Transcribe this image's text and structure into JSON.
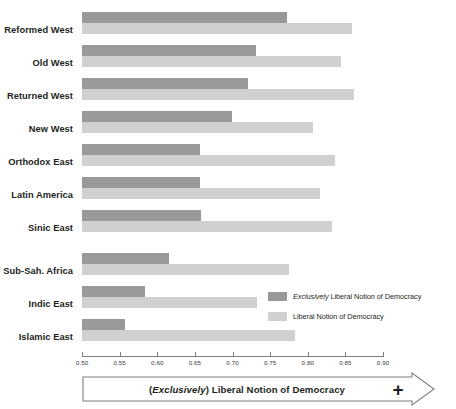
{
  "chart_data": {
    "type": "bar",
    "orientation": "horizontal",
    "title": "",
    "xlabel": "(Exclusively) Liberal Notion of Democracy",
    "ylabel": "",
    "xlim": [
      0.5,
      0.9
    ],
    "xticks": [
      "0.50",
      "0.55",
      "0.60",
      "0.65",
      "0.70",
      "0.75",
      "0.80",
      "0.85",
      "0.90"
    ],
    "xtick_values": [
      0.5,
      0.55,
      0.6,
      0.65,
      0.7,
      0.75,
      0.8,
      0.85,
      0.9
    ],
    "grid": false,
    "legend_position": "inside-right-lower",
    "categories": [
      "Reformed West",
      "Old West",
      "Returned West",
      "New West",
      "Orthodox East",
      "Latin America",
      "Sinic East",
      "Sub-Sah. Africa",
      "Indic East",
      "Islamic East"
    ],
    "series": [
      {
        "name": "Exclusively Liberal Notion of Democracy",
        "color": "#999999",
        "values": [
          0.773,
          0.731,
          0.72,
          0.699,
          0.657,
          0.657,
          0.658,
          0.616,
          0.584,
          0.557
        ]
      },
      {
        "name": "Liberal Notion of Democracy",
        "color": "#d0d0d0",
        "values": [
          0.859,
          0.844,
          0.862,
          0.807,
          0.836,
          0.816,
          0.832,
          0.775,
          0.733,
          0.783
        ]
      }
    ]
  },
  "legend": {
    "items": [
      {
        "prefix_italic": "Exclusively",
        "rest": " Liberal Notion of Democracy",
        "color": "#999999"
      },
      {
        "prefix_italic": "",
        "rest": "Liberal Notion of Democracy",
        "color": "#d0d0d0"
      }
    ]
  },
  "banner": {
    "paren_open": "(",
    "italic_word": "Exclusively",
    "paren_close": ") Liberal Notion of Democracy",
    "plus_symbol": "+"
  }
}
